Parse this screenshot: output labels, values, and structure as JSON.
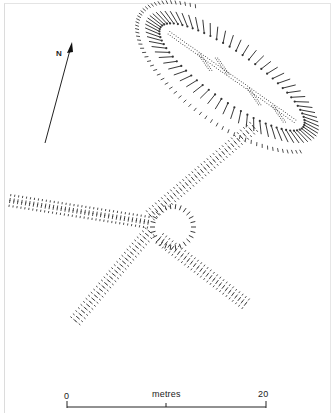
{
  "map": {
    "type": "archaeological site plan (hachured earthworks)",
    "north_arrow": {
      "label": "N",
      "tail": [
        45,
        143
      ],
      "head": [
        72,
        45
      ]
    },
    "scale_bar": {
      "min_label": "0",
      "max_label": "20",
      "unit_label": "metres",
      "x_start": 67,
      "x_end": 266,
      "y": 407,
      "mid_x": 166
    },
    "features": [
      {
        "name": "oval-enclosure",
        "description": "Elongated oval enclosure with inward hachures and internal dotted trackways",
        "center": [
          232,
          77
        ],
        "rx": 105,
        "ry": 38,
        "angle": 35
      },
      {
        "name": "central-ring",
        "description": "Small circular ring feature at junction",
        "center": [
          173,
          227
        ],
        "r": 20
      },
      {
        "name": "bank-northeast",
        "from": [
          150,
          215
        ],
        "to": [
          255,
          125
        ]
      },
      {
        "name": "bank-west",
        "from": [
          10,
          200
        ],
        "to": [
          150,
          222
        ]
      },
      {
        "name": "bank-southwest",
        "from": [
          150,
          232
        ],
        "to": [
          75,
          322
        ]
      },
      {
        "name": "bank-southeast",
        "from": [
          160,
          238
        ],
        "to": [
          248,
          305
        ]
      }
    ]
  }
}
